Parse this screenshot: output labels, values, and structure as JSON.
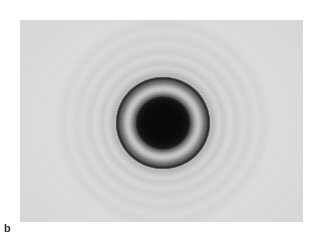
{
  "figure": {
    "label": "b",
    "caption_text": "",
    "panel": {
      "kind": "electron-diffraction-micrograph",
      "background_color": "#d7d7d6",
      "border": "none",
      "x": 20,
      "y": 20,
      "width": 283,
      "height": 202
    }
  },
  "chart_data": {
    "type": "heatmap",
    "title": "",
    "subtitle": "",
    "xlabel": "",
    "ylabel": "",
    "center": {
      "x": 163,
      "y": 123
    },
    "grid": false,
    "legend": null,
    "colors": {
      "film_background": "#d7d7d6",
      "core_dark": "#0a0a0a",
      "ring_dark": "#1c1c1c",
      "halo_light": "#e8e8e7",
      "label_color": "#2b2b2b"
    },
    "series": [
      {
        "name": "radial intensity profile",
        "xlabel": "radius (px)",
        "ylabel": "relative transmitted intensity (0 dark - 1 bright)",
        "x": [
          0,
          8,
          16,
          24,
          27,
          31,
          35,
          40,
          44,
          47,
          50,
          55,
          62,
          68,
          75,
          82,
          88,
          95,
          100,
          108,
          115
        ],
        "values": [
          0.03,
          0.03,
          0.04,
          0.06,
          0.18,
          0.46,
          0.58,
          0.52,
          0.34,
          0.12,
          0.3,
          0.62,
          0.55,
          0.72,
          0.63,
          0.78,
          0.7,
          0.82,
          0.76,
          0.85,
          0.86
        ]
      }
    ],
    "rings": [
      {
        "order": 0,
        "name": "central transmitted disc",
        "radius_px": 26,
        "intensity": "saturated dark",
        "sharpness": "soft edge"
      },
      {
        "order": 1,
        "name": "bright annulus",
        "radius_px": 33,
        "intensity": "light grey",
        "sharpness": "diffuse"
      },
      {
        "order": 2,
        "name": "strong dark ring",
        "radius_px": 47,
        "intensity": "strong dark",
        "sharpness": "sharp"
      },
      {
        "order": 3,
        "name": "faint ring",
        "radius_px": 56,
        "intensity": "faint",
        "sharpness": "diffuse"
      },
      {
        "order": 4,
        "name": "faint ring",
        "radius_px": 67,
        "intensity": "very faint",
        "sharpness": "diffuse"
      },
      {
        "order": 5,
        "name": "faint ring",
        "radius_px": 80,
        "intensity": "very faint",
        "sharpness": "diffuse"
      },
      {
        "order": 6,
        "name": "faint ring",
        "radius_px": 93,
        "intensity": "barely visible",
        "sharpness": "diffuse"
      },
      {
        "order": 7,
        "name": "outermost halo",
        "radius_px": 107,
        "intensity": "barely visible",
        "sharpness": "diffuse"
      }
    ]
  }
}
